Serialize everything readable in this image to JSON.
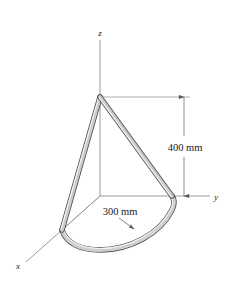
{
  "figure": {
    "background_color": "#ffffff"
  },
  "axes": {
    "x_label": "x",
    "y_label": "y",
    "z_label": "z",
    "line_color": "#8a8a8a",
    "origin": {
      "x": 100,
      "y": 196
    },
    "z_tip": {
      "x": 100,
      "y": 40
    },
    "y_tip": {
      "x": 210,
      "y": 196
    },
    "x_tip": {
      "x": 26,
      "y": 262
    }
  },
  "dimensions": [
    {
      "id": "height",
      "label": "400 mm",
      "orientation": "vertical",
      "value": 400,
      "unit": "mm",
      "from": {
        "x": 184,
        "y": 97
      },
      "to": {
        "x": 184,
        "y": 196
      },
      "label_pos": {
        "x": 185,
        "y": 147
      }
    },
    {
      "id": "radius",
      "label": "300 mm",
      "orientation": "leader",
      "value": 300,
      "unit": "mm",
      "leader_from": {
        "x": 100,
        "y": 196
      },
      "leader_to": {
        "x": 133,
        "y": 229
      },
      "label_pos": {
        "x": 119,
        "y": 215
      }
    }
  ],
  "rod": {
    "description": "Bent rod: semicircular arc of radius 300 mm in the xy-plane plus two straight segments meeting at the apex on the z-axis 400 mm above the origin",
    "outline_color": "#4d4d4d",
    "fill_color": "#c9c9c9",
    "highlight_color": "#efefef",
    "apex": {
      "x": 100,
      "y": 97
    },
    "end_on_x_axis": {
      "x": 62,
      "y": 230
    },
    "end_on_y_axis": {
      "x": 172,
      "y": 196
    },
    "arc_radius_px": 75
  },
  "construction_lines": {
    "color": "#9a9a9a",
    "apex_to_dim_extension": {
      "from": {
        "x": 100,
        "y": 97
      },
      "to": {
        "x": 190,
        "y": 97
      }
    },
    "origin_to_x_end": {
      "from": {
        "x": 100,
        "y": 196
      },
      "to": {
        "x": 62,
        "y": 230
      }
    },
    "origin_to_y_end": {
      "from": {
        "x": 100,
        "y": 196
      },
      "to": {
        "x": 172,
        "y": 196
      }
    },
    "z_segment": {
      "from": {
        "x": 100,
        "y": 97
      },
      "to": {
        "x": 100,
        "y": 196
      }
    }
  }
}
